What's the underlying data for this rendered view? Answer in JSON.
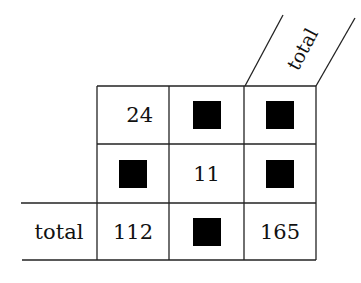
{
  "table": {
    "column_header_label": "total",
    "row_label": "total",
    "rows": [
      [
        {
          "value": "24",
          "masked": false
        },
        {
          "value": "",
          "masked": true
        },
        {
          "value": "",
          "masked": true
        }
      ],
      [
        {
          "value": "",
          "masked": true
        },
        {
          "value": "11",
          "masked": false
        },
        {
          "value": "",
          "masked": true
        }
      ],
      [
        {
          "value": "112",
          "masked": false
        },
        {
          "value": "",
          "masked": true
        },
        {
          "value": "165",
          "masked": false
        }
      ]
    ]
  }
}
